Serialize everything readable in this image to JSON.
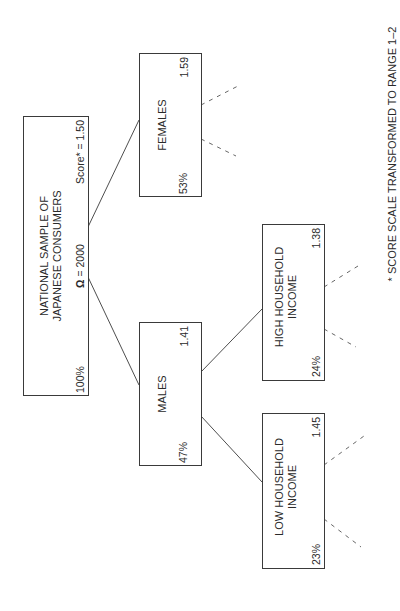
{
  "diagram": {
    "orientation": "rotated-90-counterclockwise",
    "root": {
      "title_line1": "NATIONAL SAMPLE OF",
      "title_line2": "JAPANESE CONSUMERS",
      "share": "100%",
      "n_symbol": "Ω",
      "n_text": " = 2000",
      "score_text": "Score* = 1.50"
    },
    "nodes": [
      {
        "id": "females",
        "label_line1": "FEMALES",
        "label_line2": "",
        "share": "53%",
        "score": "1.59",
        "parent": "root"
      },
      {
        "id": "males",
        "label_line1": "MALES",
        "label_line2": "",
        "share": "47%",
        "score": "1.41",
        "parent": "root"
      },
      {
        "id": "high-income",
        "label_line1": "HIGH HOUSEHOLD",
        "label_line2": "INCOME",
        "share": "24%",
        "score": "1.38",
        "parent": "males"
      },
      {
        "id": "low-income",
        "label_line1": "LOW HOUSEHOLD",
        "label_line2": "INCOME",
        "share": "23%",
        "score": "1.45",
        "parent": "males"
      }
    ],
    "footnote": "* SCORE SCALE TRANSFORMED TO RANGE 1–2",
    "colors": {
      "line": "#3a3a3a",
      "text": "#2a2a2a",
      "background": "#ffffff"
    }
  }
}
